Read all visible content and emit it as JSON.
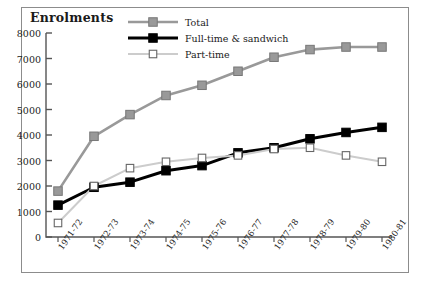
{
  "figure": {
    "title": "Enrolments"
  },
  "legend": {
    "entries": [
      {
        "label": "Total",
        "color": "#999999",
        "marker": "filled-square"
      },
      {
        "label": "Full-time & sandwich",
        "color": "#000000",
        "marker": "filled-square"
      },
      {
        "label": "Part-time",
        "color": "#cccccc",
        "marker": "open-square"
      }
    ]
  },
  "axes": {
    "y_ticks": [
      "8000",
      "7000",
      "6000",
      "5000",
      "4000",
      "3000",
      "2000",
      "1000",
      "0"
    ],
    "x_ticks": [
      "1971-72",
      "1972-73",
      "1973-74",
      "1974-75",
      "1975-76",
      "1976-77",
      "1977-78",
      "1978-79",
      "1979-80",
      "1980-81"
    ]
  },
  "chart_data": {
    "type": "line",
    "title": "Enrolments",
    "xlabel": "",
    "ylabel": "Enrolments",
    "ylim": [
      0,
      8000
    ],
    "ytick_values": [
      0,
      1000,
      2000,
      3000,
      4000,
      5000,
      6000,
      7000,
      8000
    ],
    "grid": false,
    "legend_position": "top-center",
    "categories": [
      "1971-72",
      "1972-73",
      "1973-74",
      "1974-75",
      "1975-76",
      "1976-77",
      "1977-78",
      "1978-79",
      "1979-80",
      "1980-81"
    ],
    "series": [
      {
        "name": "Total",
        "color": "#999999",
        "marker": "filled-square",
        "values": [
          1800,
          3950,
          4800,
          5550,
          5950,
          6500,
          7050,
          7350,
          7450,
          7450
        ]
      },
      {
        "name": "Full-time & sandwich",
        "color": "#000000",
        "marker": "filled-square",
        "values": [
          1250,
          1950,
          2150,
          2600,
          2800,
          3300,
          3500,
          3850,
          4100,
          4300
        ]
      },
      {
        "name": "Part-time",
        "color": "#cccccc",
        "marker": "open-square",
        "values": [
          550,
          2000,
          2700,
          2950,
          3100,
          3200,
          3450,
          3500,
          3200,
          2950
        ]
      }
    ]
  }
}
